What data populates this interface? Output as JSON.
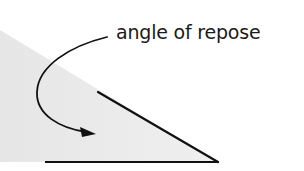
{
  "diagram": {
    "label": "angle of repose",
    "colors": {
      "background": "#ffffff",
      "pile_fill": "#ececec",
      "stroke": "#111111",
      "text": "#1a1a1a"
    },
    "elements": {
      "pile": "granular pile cross-section (shaded)",
      "slope_line": "pile surface slope",
      "base_line": "horizontal ground line",
      "arrow": "curved arrow pointing from label to angle"
    }
  }
}
